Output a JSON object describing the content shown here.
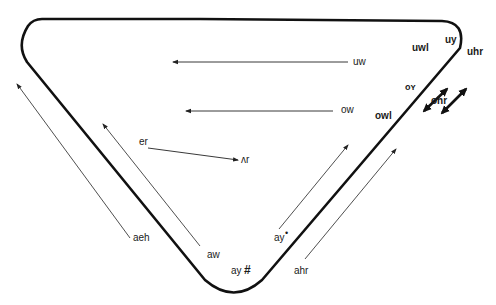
{
  "diagram": {
    "type": "vowel-shift-triangle",
    "colors": {
      "outline": "#111111",
      "arrow": "#222222",
      "background": "#ffffff"
    },
    "labels": {
      "uw": "uw",
      "ow": "ow",
      "uwl": "uwl",
      "uy": "uy",
      "oy": "oʏ",
      "uhr": "uhr",
      "ohr": "ohr",
      "owl": "owl",
      "er": "er",
      "ar": "ʌr",
      "aeh": "aeh",
      "aw": "aw",
      "ay_sharp": "ay",
      "sharp_mark": "#",
      "ay_dot": "ay",
      "dot_mark": "•",
      "ahr": "ahr"
    },
    "arrows": [
      {
        "from": "uw",
        "direction": "front (left)",
        "style": "thin"
      },
      {
        "from": "ow",
        "direction": "front (left)",
        "style": "thin"
      },
      {
        "from": "er",
        "to": "ʌr",
        "style": "thin"
      },
      {
        "from": "aeh",
        "direction": "up-left",
        "style": "thin"
      },
      {
        "from": "aw",
        "direction": "up-left",
        "style": "thin"
      },
      {
        "from": "ay•",
        "direction": "up-right",
        "style": "thin"
      },
      {
        "from": "ahr",
        "direction": "up-right",
        "style": "thin"
      },
      {
        "between": [
          "uwl",
          "oʏ"
        ],
        "style": "bold double-headed"
      },
      {
        "between": [
          "uhr",
          "ohr"
        ],
        "style": "bold double-headed"
      }
    ]
  }
}
